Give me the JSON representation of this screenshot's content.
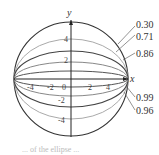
{
  "diagram": {
    "axes": {
      "x_label": "x",
      "y_label": "y",
      "x_ticks": [
        "-4",
        "-2",
        "0",
        "2",
        "4"
      ],
      "y_ticks": [
        "4",
        "2",
        "-2",
        "-4"
      ]
    },
    "eccentricity_labels": [
      "0.30",
      "0.71",
      "0.86",
      "0.99",
      "0.96"
    ],
    "curves": [
      {
        "name": "circle",
        "e": 0.0,
        "b_px": 58,
        "color": "#333333"
      },
      {
        "name": "ellipse-0.30",
        "e": 0.3,
        "b_px": 55,
        "color": "#444444"
      },
      {
        "name": "ellipse-0.71",
        "e": 0.71,
        "b_px": 41,
        "color": "#999999"
      },
      {
        "name": "ellipse-0.86",
        "e": 0.86,
        "b_px": 29,
        "color": "#444444"
      },
      {
        "name": "ellipse-0.96",
        "e": 0.96,
        "b_px": 16,
        "color": "#888888"
      },
      {
        "name": "ellipse-0.99",
        "e": 0.99,
        "b_px": 8,
        "color": "#555555"
      }
    ],
    "caption_fragment": "... of the ellipse ..."
  }
}
